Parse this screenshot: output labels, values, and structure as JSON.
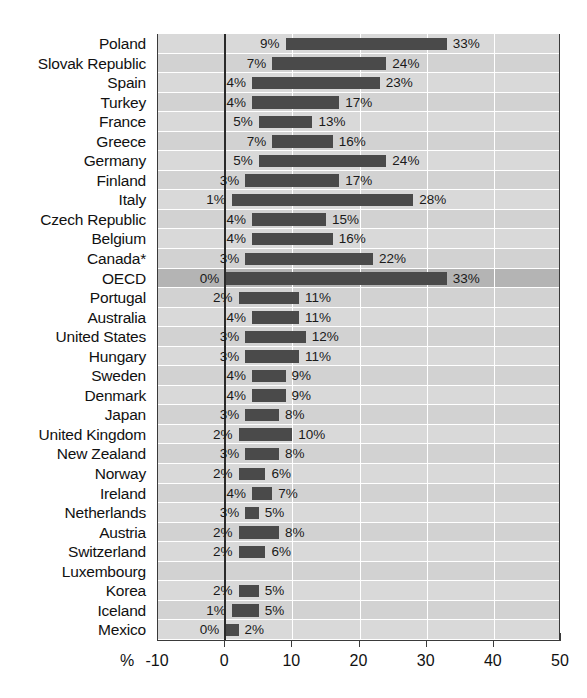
{
  "chart_data": {
    "type": "bar",
    "orientation": "horizontal",
    "title": "",
    "subtitle": "",
    "xlabel": "%",
    "ylabel": "",
    "xlim": [
      -10,
      50
    ],
    "xticks": [
      -10,
      0,
      10,
      20,
      30,
      40,
      50
    ],
    "xtick_labels": [
      "-10",
      "0",
      "10",
      "20",
      "30",
      "40",
      "50"
    ],
    "grid": true,
    "legend": false,
    "note": "Each row shows a range bar spanning from a low value to a high value; both endpoints are labelled in percent.",
    "categories": [
      "Poland",
      "Slovak Republic",
      "Spain",
      "Turkey",
      "France",
      "Greece",
      "Germany",
      "Finland",
      "Italy",
      "Czech Republic",
      "Belgium",
      "Canada*",
      "OECD",
      "Portugal",
      "Australia",
      "United States",
      "Hungary",
      "Sweden",
      "Denmark",
      "Japan",
      "United Kingdom",
      "New Zealand",
      "Norway",
      "Ireland",
      "Netherlands",
      "Austria",
      "Switzerland",
      "Luxembourg",
      "Korea",
      "Iceland",
      "Mexico"
    ],
    "series": [
      {
        "name": "low",
        "values": [
          9,
          7,
          4,
          4,
          5,
          7,
          5,
          3,
          1,
          4,
          4,
          3,
          0,
          2,
          4,
          3,
          3,
          4,
          4,
          3,
          2,
          3,
          2,
          4,
          3,
          2,
          2,
          null,
          2,
          1,
          0
        ]
      },
      {
        "name": "high",
        "values": [
          33,
          24,
          23,
          17,
          13,
          16,
          24,
          17,
          28,
          15,
          16,
          22,
          33,
          11,
          11,
          12,
          11,
          9,
          9,
          8,
          10,
          8,
          6,
          7,
          5,
          8,
          6,
          null,
          5,
          5,
          2
        ]
      }
    ],
    "rows": [
      {
        "label": "Poland",
        "low": 9,
        "high": 33,
        "low_text": "9%",
        "high_text": "33%",
        "highlight": false
      },
      {
        "label": "Slovak Republic",
        "low": 7,
        "high": 24,
        "low_text": "7%",
        "high_text": "24%",
        "highlight": false
      },
      {
        "label": "Spain",
        "low": 4,
        "high": 23,
        "low_text": "4%",
        "high_text": "23%",
        "highlight": false
      },
      {
        "label": "Turkey",
        "low": 4,
        "high": 17,
        "low_text": "4%",
        "high_text": "17%",
        "highlight": false
      },
      {
        "label": "France",
        "low": 5,
        "high": 13,
        "low_text": "5%",
        "high_text": "13%",
        "highlight": false
      },
      {
        "label": "Greece",
        "low": 7,
        "high": 16,
        "low_text": "7%",
        "high_text": "16%",
        "highlight": false
      },
      {
        "label": "Germany",
        "low": 5,
        "high": 24,
        "low_text": "5%",
        "high_text": "24%",
        "highlight": false
      },
      {
        "label": "Finland",
        "low": 3,
        "high": 17,
        "low_text": "3%",
        "high_text": "17%",
        "highlight": false
      },
      {
        "label": "Italy",
        "low": 1,
        "high": 28,
        "low_text": "1%",
        "high_text": "28%",
        "highlight": false
      },
      {
        "label": "Czech Republic",
        "low": 4,
        "high": 15,
        "low_text": "4%",
        "high_text": "15%",
        "highlight": false
      },
      {
        "label": "Belgium",
        "low": 4,
        "high": 16,
        "low_text": "4%",
        "high_text": "16%",
        "highlight": false
      },
      {
        "label": "Canada*",
        "low": 3,
        "high": 22,
        "low_text": "3%",
        "high_text": "22%",
        "highlight": false
      },
      {
        "label": "OECD",
        "low": 0,
        "high": 33,
        "low_text": "0%",
        "high_text": "33%",
        "highlight": true
      },
      {
        "label": "Portugal",
        "low": 2,
        "high": 11,
        "low_text": "2%",
        "high_text": "11%",
        "highlight": false
      },
      {
        "label": "Australia",
        "low": 4,
        "high": 11,
        "low_text": "4%",
        "high_text": "11%",
        "highlight": false
      },
      {
        "label": "United States",
        "low": 3,
        "high": 12,
        "low_text": "3%",
        "high_text": "12%",
        "highlight": false
      },
      {
        "label": "Hungary",
        "low": 3,
        "high": 11,
        "low_text": "3%",
        "high_text": "11%",
        "highlight": false
      },
      {
        "label": "Sweden",
        "low": 4,
        "high": 9,
        "low_text": "4%",
        "high_text": "9%",
        "highlight": false
      },
      {
        "label": "Denmark",
        "low": 4,
        "high": 9,
        "low_text": "4%",
        "high_text": "9%",
        "highlight": false
      },
      {
        "label": "Japan",
        "low": 3,
        "high": 8,
        "low_text": "3%",
        "high_text": "8%",
        "highlight": false
      },
      {
        "label": "United Kingdom",
        "low": 2,
        "high": 10,
        "low_text": "2%",
        "high_text": "10%",
        "highlight": false
      },
      {
        "label": "New Zealand",
        "low": 3,
        "high": 8,
        "low_text": "3%",
        "high_text": "8%",
        "highlight": false
      },
      {
        "label": "Norway",
        "low": 2,
        "high": 6,
        "low_text": "2%",
        "high_text": "6%",
        "highlight": false
      },
      {
        "label": "Ireland",
        "low": 4,
        "high": 7,
        "low_text": "4%",
        "high_text": "7%",
        "highlight": false
      },
      {
        "label": "Netherlands",
        "low": 3,
        "high": 5,
        "low_text": "3%",
        "high_text": "5%",
        "highlight": false
      },
      {
        "label": "Austria",
        "low": 2,
        "high": 8,
        "low_text": "2%",
        "high_text": "8%",
        "highlight": false
      },
      {
        "label": "Switzerland",
        "low": 2,
        "high": 6,
        "low_text": "2%",
        "high_text": "6%",
        "highlight": false
      },
      {
        "label": "Luxembourg",
        "low": null,
        "high": null,
        "low_text": "",
        "high_text": "",
        "highlight": false
      },
      {
        "label": "Korea",
        "low": 2,
        "high": 5,
        "low_text": "2%",
        "high_text": "5%",
        "highlight": false
      },
      {
        "label": "Iceland",
        "low": 1,
        "high": 5,
        "low_text": "1%",
        "high_text": "5%",
        "highlight": false
      },
      {
        "label": "Mexico",
        "low": 0,
        "high": 2,
        "low_text": "0%",
        "high_text": "2%",
        "highlight": false
      }
    ],
    "colors": {
      "bar": "#4a4a4a",
      "plot_background": "#d9d9d9",
      "row_alt_background": "#d2d2d2",
      "highlight_row_background": "#b4b4b4",
      "gridline": "#ffffff",
      "zeroline": "#2a2a2a",
      "axis": "#3a3a3a",
      "text": "#111111"
    }
  }
}
